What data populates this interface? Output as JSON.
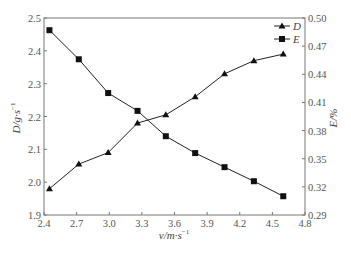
{
  "chart_data": {
    "type": "line",
    "title": "",
    "xlabel": "v/m·s⁻¹",
    "ylabel": "D/g·s⁻¹",
    "y2label": "E/%",
    "xlim": [
      2.4,
      4.8
    ],
    "ylim": [
      1.9,
      2.5
    ],
    "y2lim": [
      0.29,
      0.5
    ],
    "x_ticks": [
      "2.4",
      "2.7",
      "3.0",
      "3.3",
      "3.6",
      "3.9",
      "4.2",
      "4.5",
      "4.8"
    ],
    "y_ticks": [
      "1.9",
      "2.0",
      "2.1",
      "2.2",
      "2.3",
      "2.4",
      "2.5"
    ],
    "y2_ticks": [
      "0.29",
      "0.32",
      "0.35",
      "0.38",
      "0.41",
      "0.44",
      "0.47",
      "0.50"
    ],
    "grid": false,
    "legend_position": "upper right",
    "x": [
      2.45,
      2.72,
      2.99,
      3.26,
      3.52,
      3.79,
      4.06,
      4.33,
      4.6
    ],
    "series": [
      {
        "name": "D",
        "axis": "left",
        "marker": "triangle",
        "values": [
          1.98,
          2.055,
          2.09,
          2.18,
          2.205,
          2.26,
          2.33,
          2.37,
          2.39
        ]
      },
      {
        "name": "E",
        "axis": "right",
        "marker": "square",
        "values": [
          0.487,
          0.456,
          0.42,
          0.401,
          0.374,
          0.356,
          0.341,
          0.326,
          0.31
        ]
      }
    ]
  },
  "labels": {
    "xlabel_main": "v/m·s",
    "xlabel_sup": "−1",
    "ylabel_main": "D/g·s",
    "ylabel_sup": "−1",
    "y2label": "E/%",
    "legend_D": "D",
    "legend_E": "E"
  }
}
